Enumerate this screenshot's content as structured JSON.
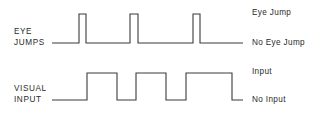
{
  "figure": {
    "background_color": "#ffffff",
    "stroke_color": "#3a3a3a",
    "text_color": "#2b2b2b",
    "width": 319,
    "height": 114
  },
  "traces": {
    "eye_jumps": {
      "row_label_line1": "EYE",
      "row_label_line2": "JUMPS",
      "high_label": "Eye Jump",
      "low_label": "No Eye Jump",
      "baseline_y": 43,
      "high_y": 14,
      "start_x": 52,
      "end_x": 243,
      "pulses": [
        {
          "rise_x": 79,
          "fall_x": 86
        },
        {
          "rise_x": 130,
          "fall_x": 138
        },
        {
          "rise_x": 193,
          "fall_x": 200
        }
      ]
    },
    "visual_input": {
      "row_label_line1": "VISUAL",
      "row_label_line2": "INPUT",
      "high_label": "Input",
      "low_label": "No Input",
      "baseline_y": 100,
      "high_y": 73,
      "start_x": 52,
      "end_x": 243,
      "pulses": [
        {
          "rise_x": 87,
          "fall_x": 117
        },
        {
          "rise_x": 136,
          "fall_x": 166
        },
        {
          "rise_x": 186,
          "fall_x": 232
        }
      ]
    }
  },
  "chart_data": {
    "type": "line",
    "title": "",
    "subtitle": "",
    "xlabel": "",
    "ylabel": "",
    "grid": false,
    "legend_position": "right",
    "series": [
      {
        "name": "EYE JUMPS",
        "high_state": "Eye Jump",
        "low_state": "No Eye Jump",
        "x": [
          52,
          79,
          79,
          86,
          86,
          130,
          130,
          138,
          138,
          193,
          193,
          200,
          200,
          243
        ],
        "values": [
          0,
          0,
          1,
          1,
          0,
          0,
          1,
          1,
          0,
          0,
          1,
          1,
          0,
          0
        ]
      },
      {
        "name": "VISUAL INPUT",
        "high_state": "Input",
        "low_state": "No Input",
        "x": [
          52,
          87,
          87,
          117,
          117,
          136,
          136,
          166,
          166,
          186,
          186,
          232,
          232,
          243
        ],
        "values": [
          0,
          0,
          1,
          1,
          0,
          0,
          1,
          1,
          0,
          0,
          1,
          1,
          0,
          0
        ]
      }
    ],
    "ylim": [
      0,
      1
    ],
    "xlim": [
      52,
      243
    ],
    "ytick_labels": [
      "No Eye Jump",
      "Eye Jump",
      "No Input",
      "Input"
    ]
  }
}
